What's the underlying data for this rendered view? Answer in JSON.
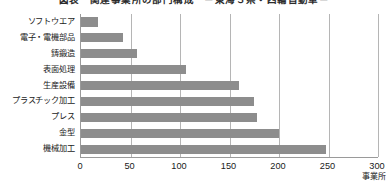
{
  "chart_data": {
    "type": "bar",
    "orientation": "horizontal",
    "title": "図表　関連事業所の部門構成　－東海３県・四輪自動車－",
    "xlabel": "",
    "ylabel": "",
    "x_unit": "事業所",
    "xlim": [
      0,
      300
    ],
    "xticks": [
      0,
      50,
      100,
      150,
      200,
      250,
      300
    ],
    "xtick_labels": [
      "0",
      "50",
      "100",
      "150",
      "200",
      "250",
      "300"
    ],
    "grid": true,
    "grid_axis": "x",
    "legend": "none",
    "bar_color": "#8d8d8d",
    "axis_color": "#9a9a9a",
    "grid_color": "#b5b5b5",
    "categories": [
      "ソフトウエア",
      "電子・電機部品",
      "鋳鍛造",
      "表面処理",
      "生産設備",
      "プラスチック加工",
      "プレス",
      "金型",
      "機械加工"
    ],
    "values": [
      17,
      42,
      57,
      106,
      160,
      175,
      178,
      200,
      247
    ]
  }
}
